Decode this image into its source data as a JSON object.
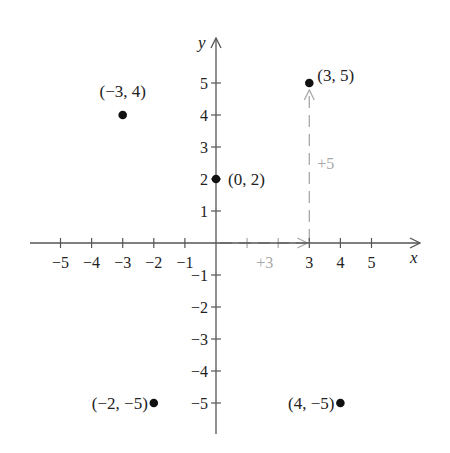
{
  "chart_data": {
    "type": "scatter",
    "title": "",
    "xlabel": "x",
    "ylabel": "y",
    "xlim": [
      -6,
      6
    ],
    "ylim": [
      -6,
      6
    ],
    "grid": false,
    "x_ticks": [
      -5,
      -4,
      -3,
      -2,
      -1,
      3,
      4,
      5
    ],
    "x_tick_labels": [
      "−5",
      "−4",
      "−3",
      "−2",
      "−1",
      "3",
      "4",
      "5"
    ],
    "y_ticks": [
      5,
      4,
      3,
      2,
      1,
      -1,
      -2,
      -3,
      -4,
      -5
    ],
    "y_tick_labels": [
      "5",
      "4",
      "3",
      "2",
      "1",
      "−1",
      "−2",
      "−3",
      "−4",
      "−5"
    ],
    "points": [
      {
        "x": -3,
        "y": 4,
        "label": "(−3, 4)"
      },
      {
        "x": 0,
        "y": 2,
        "label": "(0, 2)"
      },
      {
        "x": 3,
        "y": 5,
        "label": "(3, 5)"
      },
      {
        "x": -2,
        "y": -5,
        "label": "(−2, −5)"
      },
      {
        "x": 4,
        "y": -5,
        "label": "(4, −5)"
      }
    ],
    "annotations": [
      {
        "type": "dashed-arrow",
        "from": [
          0,
          0
        ],
        "to": [
          3,
          0
        ],
        "label": "+3",
        "color": "#a8a8a8"
      },
      {
        "type": "dashed-arrow",
        "from": [
          3,
          0
        ],
        "to": [
          3,
          5
        ],
        "label": "+5",
        "color": "#a8a8a8"
      }
    ]
  },
  "colors": {
    "axis": "#555555",
    "point": "#111111",
    "text": "#222222",
    "annotation": "#a8a8a8"
  }
}
